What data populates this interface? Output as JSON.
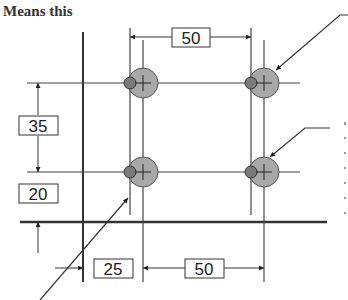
{
  "title": "Means this",
  "dimensions": {
    "top_horizontal": "50",
    "left_vertical_upper": "35",
    "left_vertical_lower": "20",
    "bottom_left_horizontal": "25",
    "bottom_right_horizontal": "50"
  },
  "colors": {
    "line": "#333333",
    "hole_fill": "#a8a8a8",
    "pin_fill": "#7a7a7a",
    "background": "#ffffff"
  },
  "holes": [
    {
      "cx": 143,
      "cy": 83
    },
    {
      "cx": 264,
      "cy": 83
    },
    {
      "cx": 143,
      "cy": 172
    },
    {
      "cx": 264,
      "cy": 172
    }
  ]
}
